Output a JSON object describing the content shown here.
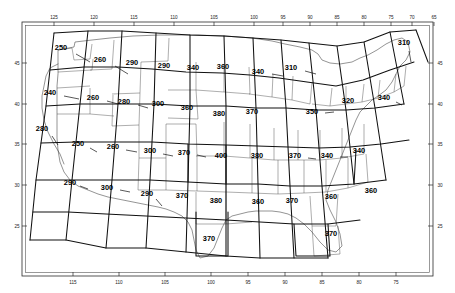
{
  "axes": {
    "top": {
      "name": "longitude-top-axis",
      "labels": [
        "125",
        "120",
        "115",
        "110",
        "105",
        "100",
        "95",
        "90",
        "85",
        "80",
        "75",
        "70",
        "65"
      ],
      "positions": [
        54,
        94,
        134,
        174,
        214,
        254,
        283,
        310,
        337,
        364,
        391,
        412,
        434
      ]
    },
    "bottom": {
      "name": "longitude-bottom-axis",
      "labels": [
        "115",
        "110",
        "105",
        "100",
        "95",
        "90",
        "85",
        "80",
        "75"
      ],
      "positions": [
        73,
        119,
        165,
        211,
        248,
        285,
        322,
        359,
        396
      ]
    },
    "left": {
      "name": "latitude-left-axis",
      "labels": [
        "45",
        "40",
        "35",
        "30",
        "25"
      ],
      "positions": [
        63,
        104,
        144,
        185,
        226
      ]
    },
    "right": {
      "name": "latitude-right-axis",
      "labels": [
        "45",
        "40",
        "35",
        "30",
        "25"
      ],
      "positions": [
        63,
        104,
        144,
        185,
        226
      ]
    }
  },
  "chart_data": {
    "type": "map",
    "title": "",
    "xlabel": "",
    "ylabel": "",
    "xlim": [
      -127,
      -64
    ],
    "ylim": [
      22,
      49
    ],
    "grid": true,
    "legend": "none",
    "cells": [
      {
        "label": "250",
        "x": 61,
        "y": 50,
        "lx": 76,
        "ly": 54,
        "lx2": 90,
        "ly2": 62
      },
      {
        "label": "260",
        "x": 100,
        "y": 62,
        "lx": 115,
        "ly": 66,
        "lx2": 128,
        "ly2": 74
      },
      {
        "label": "290",
        "x": 132,
        "y": 65,
        "lx": null,
        "ly": null,
        "lx2": null,
        "ly2": null
      },
      {
        "label": "290",
        "x": 164,
        "y": 68,
        "lx": null,
        "ly": null,
        "lx2": null,
        "ly2": null
      },
      {
        "label": "340",
        "x": 193,
        "y": 70,
        "lx": null,
        "ly": null,
        "lx2": null,
        "ly2": null
      },
      {
        "label": "360",
        "x": 223,
        "y": 69,
        "lx": null,
        "ly": null,
        "lx2": null,
        "ly2": null
      },
      {
        "label": "340",
        "x": 258,
        "y": 74,
        "lx": 272,
        "ly": 74,
        "lx2": 283,
        "ly2": 76
      },
      {
        "label": "310",
        "x": 291,
        "y": 70,
        "lx": 305,
        "ly": 71,
        "lx2": 316,
        "ly2": 74
      },
      {
        "label": "310",
        "x": 404,
        "y": 45,
        "lx": 409,
        "ly": 51,
        "lx2": 411,
        "ly2": 62
      },
      {
        "label": "240",
        "x": 50,
        "y": 95,
        "lx": 64,
        "ly": 96,
        "lx2": 79,
        "ly2": 99
      },
      {
        "label": "260",
        "x": 93,
        "y": 100,
        "lx": 107,
        "ly": 101,
        "lx2": 118,
        "ly2": 104
      },
      {
        "label": "280",
        "x": 124,
        "y": 104,
        "lx": 138,
        "ly": 105,
        "lx2": 148,
        "ly2": 108
      },
      {
        "label": "300",
        "x": 158,
        "y": 106,
        "lx": null,
        "ly": null,
        "lx2": null,
        "ly2": null
      },
      {
        "label": "360",
        "x": 187,
        "y": 110,
        "lx": null,
        "ly": null,
        "lx2": null,
        "ly2": null
      },
      {
        "label": "380",
        "x": 219,
        "y": 116,
        "lx": null,
        "ly": null,
        "lx2": null,
        "ly2": null
      },
      {
        "label": "370",
        "x": 252,
        "y": 114,
        "lx": null,
        "ly": null,
        "lx2": null,
        "ly2": null
      },
      {
        "label": "350",
        "x": 312,
        "y": 114,
        "lx": 325,
        "ly": 113,
        "lx2": 334,
        "ly2": 112
      },
      {
        "label": "320",
        "x": 348,
        "y": 103,
        "lx": null,
        "ly": null,
        "lx2": null,
        "ly2": null
      },
      {
        "label": "340",
        "x": 384,
        "y": 100,
        "lx": 396,
        "ly": 102,
        "lx2": 402,
        "ly2": 105
      },
      {
        "label": "280",
        "x": 42,
        "y": 131,
        "lx": 52,
        "ly": 136,
        "lx2": 58,
        "ly2": 145
      },
      {
        "label": "250",
        "x": 78,
        "y": 146,
        "lx": 90,
        "ly": 148,
        "lx2": 97,
        "ly2": 152
      },
      {
        "label": "260",
        "x": 113,
        "y": 149,
        "lx": 126,
        "ly": 150,
        "lx2": 137,
        "ly2": 152
      },
      {
        "label": "300",
        "x": 150,
        "y": 153,
        "lx": 163,
        "ly": 154,
        "lx2": 173,
        "ly2": 156
      },
      {
        "label": "370",
        "x": 184,
        "y": 155,
        "lx": 197,
        "ly": 155,
        "lx2": 206,
        "ly2": 157
      },
      {
        "label": "400",
        "x": 221,
        "y": 158,
        "lx": null,
        "ly": null,
        "lx2": null,
        "ly2": null
      },
      {
        "label": "380",
        "x": 257,
        "y": 158,
        "lx": null,
        "ly": null,
        "lx2": null,
        "ly2": null
      },
      {
        "label": "370",
        "x": 295,
        "y": 158,
        "lx": 308,
        "ly": 158,
        "lx2": 316,
        "ly2": 159
      },
      {
        "label": "340",
        "x": 327,
        "y": 158,
        "lx": 340,
        "ly": 157,
        "lx2": 348,
        "ly2": 157
      },
      {
        "label": "340",
        "x": 359,
        "y": 153,
        "lx": null,
        "ly": null,
        "lx2": null,
        "ly2": null
      },
      {
        "label": "290",
        "x": 70,
        "y": 185,
        "lx": 80,
        "ly": 186,
        "lx2": 88,
        "ly2": 189
      },
      {
        "label": "300",
        "x": 107,
        "y": 190,
        "lx": 120,
        "ly": 190,
        "lx2": 130,
        "ly2": 192
      },
      {
        "label": "290",
        "x": 147,
        "y": 196,
        "lx": 156,
        "ly": 199,
        "lx2": 162,
        "ly2": 206
      },
      {
        "label": "370",
        "x": 182,
        "y": 198,
        "lx": null,
        "ly": null,
        "lx2": null,
        "ly2": null
      },
      {
        "label": "380",
        "x": 216,
        "y": 203,
        "lx": null,
        "ly": null,
        "lx2": null,
        "ly2": null
      },
      {
        "label": "360",
        "x": 258,
        "y": 204,
        "lx": null,
        "ly": null,
        "lx2": null,
        "ly2": null
      },
      {
        "label": "370",
        "x": 292,
        "y": 203,
        "lx": null,
        "ly": null,
        "lx2": null,
        "ly2": null
      },
      {
        "label": "360",
        "x": 331,
        "y": 199,
        "lx": null,
        "ly": null,
        "lx2": null,
        "ly2": null
      },
      {
        "label": "360",
        "x": 371,
        "y": 193,
        "lx": null,
        "ly": null,
        "lx2": null,
        "ly2": null
      },
      {
        "label": "370",
        "x": 209,
        "y": 241,
        "lx": null,
        "ly": null,
        "lx2": null,
        "ly2": null
      },
      {
        "label": "370",
        "x": 331,
        "y": 236,
        "lx": null,
        "ly": null,
        "lx2": null,
        "ly2": null
      }
    ],
    "value_min": 240,
    "value_max": 400,
    "value_step": 10,
    "cell_count": 41
  }
}
